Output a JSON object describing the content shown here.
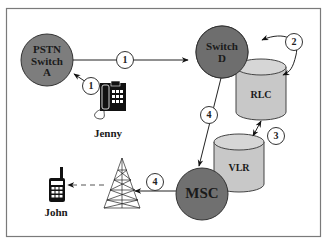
{
  "diagram": {
    "type": "mobile-call-delivery-flow",
    "colors": {
      "frame": "#7a7a7a",
      "switch_fill": "#7d7d7d",
      "msc_fill": "#707070",
      "database_fill": "#c8c8c8",
      "line": "#222222",
      "background": "#ffffff"
    },
    "nodes": [
      {
        "id": "pstn_switch_a",
        "label_lines": [
          "PSTN",
          "Switch",
          "A"
        ],
        "shape": "circle"
      },
      {
        "id": "switch_d",
        "label_lines": [
          "Switch",
          "D"
        ],
        "shape": "circle"
      },
      {
        "id": "rlc",
        "label": "RLC",
        "shape": "cylinder"
      },
      {
        "id": "vlr",
        "label": "VLR",
        "shape": "cylinder"
      },
      {
        "id": "msc",
        "label": "MSC",
        "shape": "circle"
      },
      {
        "id": "base_station",
        "label": "",
        "shape": "tower-icon"
      },
      {
        "id": "jenny_phone",
        "label": "",
        "shape": "desk-phone-icon"
      },
      {
        "id": "john_phone",
        "label": "",
        "shape": "mobile-phone-icon"
      }
    ],
    "people": {
      "jenny": "Jenny",
      "john": "John"
    },
    "steps": {
      "s1a": "1",
      "s1b": "1",
      "s2": "2",
      "s3": "3",
      "s4a": "4",
      "s4b": "4"
    },
    "edges": [
      {
        "from": "jenny_phone",
        "to": "pstn_switch_a",
        "step": "1"
      },
      {
        "from": "pstn_switch_a",
        "to": "switch_d",
        "step": "1"
      },
      {
        "from": "switch_d",
        "to": "rlc",
        "step": "2",
        "bidirectional": true
      },
      {
        "from": "rlc",
        "to": "vlr",
        "step": "3",
        "bidirectional": true
      },
      {
        "from": "switch_d",
        "to": "msc",
        "step": "4"
      },
      {
        "from": "msc",
        "to": "base_station",
        "step": "4"
      },
      {
        "from": "base_station",
        "to": "john_phone",
        "style": "dashed"
      }
    ]
  }
}
